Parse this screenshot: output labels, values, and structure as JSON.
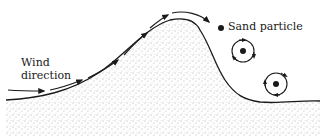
{
  "diagram": {
    "labels": {
      "wind_line1": "Wind",
      "wind_line2": "direction",
      "particle": "Sand particle"
    },
    "colors": {
      "ink": "#1a1a1a",
      "sand_dots": "#555555",
      "background": "#ffffff"
    },
    "elements": [
      "dune",
      "wind-arrows",
      "sand-particle",
      "eddy-upper",
      "eddy-lower"
    ]
  }
}
